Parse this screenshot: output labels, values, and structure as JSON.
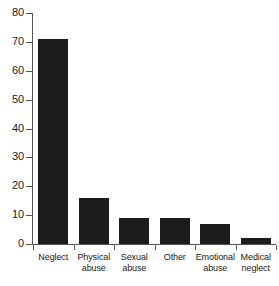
{
  "chart_data": {
    "type": "bar",
    "title": "",
    "subtitle": "",
    "xlabel": "",
    "ylabel": "",
    "categories": [
      "Neglect",
      "Physical abuse",
      "Sexual abuse",
      "Other",
      "Emotional abuse",
      "Medical neglect"
    ],
    "category_lines": [
      [
        "Neglect"
      ],
      [
        "Physical",
        "abuse"
      ],
      [
        "Sexual",
        "abuse"
      ],
      [
        "Other"
      ],
      [
        "Emotional",
        "abuse"
      ],
      [
        "Medical",
        "neglect"
      ]
    ],
    "values": [
      71,
      16,
      9,
      9,
      7,
      2
    ],
    "ylim": [
      0,
      80
    ],
    "ytick_values": [
      80,
      70,
      60,
      50,
      40,
      30,
      20,
      10,
      0
    ],
    "ytick_labels": [
      "80",
      "70",
      "60",
      "50",
      "40",
      "30",
      "20",
      "10",
      "0"
    ],
    "grid": false,
    "legend": false,
    "legend_position": "none",
    "bar_color": "#1c1c1c",
    "axis_color": "#555555",
    "text_color": "#1a1a1a",
    "background_color": "#ffffff"
  }
}
